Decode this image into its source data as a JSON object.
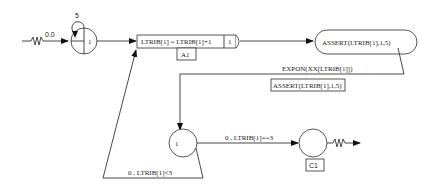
{
  "diagram": {
    "type": "simulation-network",
    "nodes": {
      "create": {
        "label": "1",
        "top_value": "5",
        "input_label": "0.0"
      },
      "assign": {
        "expression": "LTRIB[1] = LTRIB[1]+1",
        "count": "1",
        "tag": "A1"
      },
      "activity": {
        "expression": "ASSERT(LTRIB[1],1,5)"
      },
      "goon": {
        "label": "1"
      },
      "collect": {
        "tag": "C1"
      }
    },
    "edges": {
      "expon": "EXPON(XX[LTRIB[1]])",
      "assert_box": "ASSERT(LTRIB[1],1,5)",
      "loop": "0 , LTRIB[1]<3",
      "exit": "0 , LTRIB[1]==3"
    }
  }
}
